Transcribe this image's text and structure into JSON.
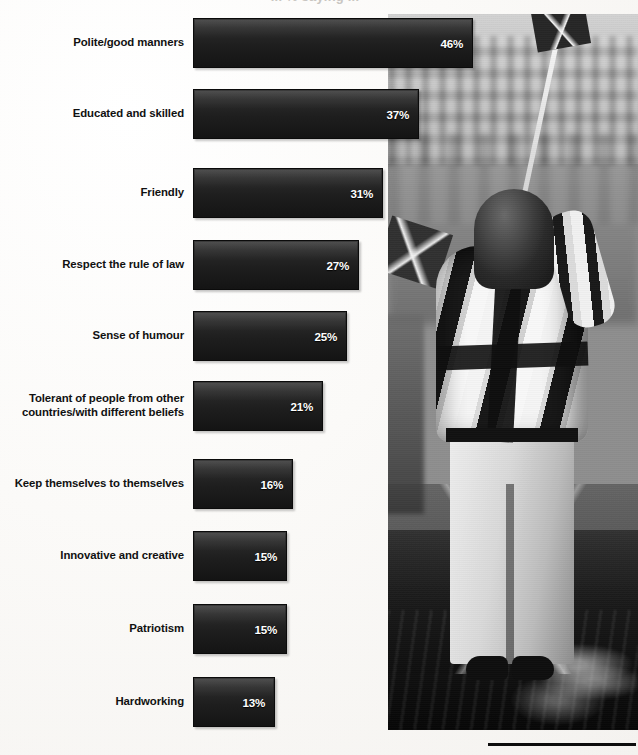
{
  "figure": {
    "cropped_title": "... % saying ...",
    "photo_caption_alt": "Black and white photograph of a person wrapped in a Union Jack flag holding a small flag"
  },
  "chart_data": {
    "type": "bar",
    "orientation": "horizontal",
    "title": "",
    "xlabel": "",
    "ylabel": "",
    "grid": false,
    "legend": false,
    "value_suffix": "%",
    "xlim": [
      0,
      50
    ],
    "categories": [
      "Polite/good manners",
      "Educated and skilled",
      "Friendly",
      "Respect the rule of law",
      "Sense of humour",
      "Tolerant of people from other countries/with different beliefs",
      "Keep themselves to themselves",
      "Innovative and creative",
      "Patriotism",
      "Hardworking"
    ],
    "values": [
      46,
      37,
      31,
      27,
      25,
      21,
      16,
      15,
      15,
      13
    ],
    "labels": [
      "46%",
      "37%",
      "31%",
      "27%",
      "25%",
      "21%",
      "16%",
      "15%",
      "15%",
      "13%"
    ],
    "bar_color": "#1e1e1e",
    "label_color": "#111111",
    "value_label_color": "#ffffff"
  },
  "rows": [
    {
      "label": "Polite/good manners",
      "label_line2": "",
      "value": "46%"
    },
    {
      "label": "Educated and skilled",
      "label_line2": "",
      "value": "37%"
    },
    {
      "label": "Friendly",
      "label_line2": "",
      "value": "31%"
    },
    {
      "label": "Respect the rule of law",
      "label_line2": "",
      "value": "27%"
    },
    {
      "label": "Sense of humour",
      "label_line2": "",
      "value": "25%"
    },
    {
      "label": "Tolerant of people from other",
      "label_line2": "countries/with different beliefs",
      "value": "21%"
    },
    {
      "label": "Keep themselves to themselves",
      "label_line2": "",
      "value": "16%"
    },
    {
      "label": "Innovative and creative",
      "label_line2": "",
      "value": "15%"
    },
    {
      "label": "Patriotism",
      "label_line2": "",
      "value": "15%"
    },
    {
      "label": "Hardworking",
      "label_line2": "",
      "value": "13%"
    }
  ]
}
